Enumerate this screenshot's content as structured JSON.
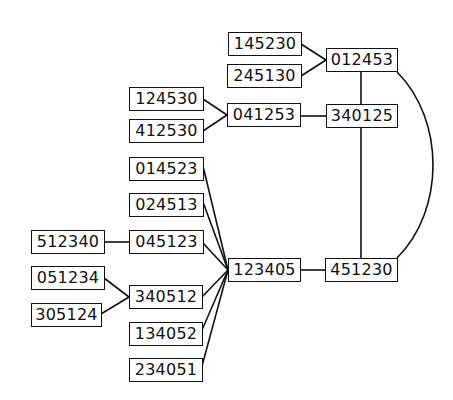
{
  "diagram": {
    "type": "graph",
    "nodes": [
      {
        "id": "n145230",
        "label": "145230"
      },
      {
        "id": "n245130",
        "label": "245130"
      },
      {
        "id": "n012453",
        "label": "012453"
      },
      {
        "id": "n124530",
        "label": "124530"
      },
      {
        "id": "n412530",
        "label": "412530"
      },
      {
        "id": "n041253",
        "label": "041253"
      },
      {
        "id": "n340125",
        "label": "340125"
      },
      {
        "id": "n014523",
        "label": "014523"
      },
      {
        "id": "n024513",
        "label": "024513"
      },
      {
        "id": "n512340",
        "label": "512340"
      },
      {
        "id": "n045123",
        "label": "045123"
      },
      {
        "id": "n123405",
        "label": "123405"
      },
      {
        "id": "n451230",
        "label": "451230"
      },
      {
        "id": "n051234",
        "label": "051234"
      },
      {
        "id": "n340512",
        "label": "340512"
      },
      {
        "id": "n305124",
        "label": "305124"
      },
      {
        "id": "n134052",
        "label": "134052"
      },
      {
        "id": "n234051",
        "label": "234051"
      }
    ],
    "edges": [
      [
        "145230",
        "012453"
      ],
      [
        "245130",
        "012453"
      ],
      [
        "124530",
        "041253"
      ],
      [
        "412530",
        "041253"
      ],
      [
        "041253",
        "340125"
      ],
      [
        "012453",
        "340125"
      ],
      [
        "340125",
        "451230"
      ],
      [
        "012453",
        "451230"
      ],
      [
        "014523",
        "123405"
      ],
      [
        "024513",
        "123405"
      ],
      [
        "045123",
        "123405"
      ],
      [
        "512340",
        "045123"
      ],
      [
        "340512",
        "123405"
      ],
      [
        "051234",
        "340512"
      ],
      [
        "305124",
        "340512"
      ],
      [
        "134052",
        "123405"
      ],
      [
        "234051",
        "123405"
      ],
      [
        "123405",
        "451230"
      ]
    ]
  }
}
